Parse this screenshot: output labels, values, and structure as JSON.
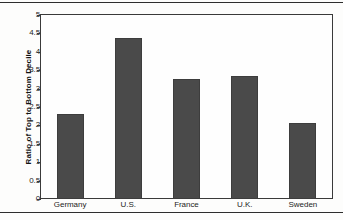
{
  "chart_data": {
    "type": "bar",
    "title": "",
    "xlabel": "",
    "ylabel": "Ratio of Top to Bottom Decile",
    "categories": [
      "Germany",
      "U.S.",
      "France",
      "U.K.",
      "Sweden"
    ],
    "values": [
      2.3,
      4.38,
      3.26,
      3.34,
      2.07
    ],
    "ylim": [
      0,
      5
    ],
    "ytick_labels": [
      "0",
      "0.5",
      "1",
      "1.5",
      "2",
      "2.5",
      "3",
      "3.5",
      "4",
      "4.5",
      "5"
    ],
    "ytick_values": [
      0,
      0.5,
      1,
      1.5,
      2,
      2.5,
      3,
      3.5,
      4,
      4.5,
      5
    ],
    "grid": false,
    "legend": null,
    "series": [
      {
        "name": "Ratio of Top to Bottom Decile",
        "values": [
          2.3,
          4.38,
          3.26,
          3.34,
          2.07
        ],
        "color": "#4a4a4a"
      }
    ]
  },
  "colors": {
    "bar_fill": "#4a4a4a",
    "bar_stroke": "#3d3d3d",
    "axis": "#3a3a3a",
    "text": "#1d1d1d",
    "background": "#fdfdfc",
    "rule": "#2e2e2e"
  }
}
